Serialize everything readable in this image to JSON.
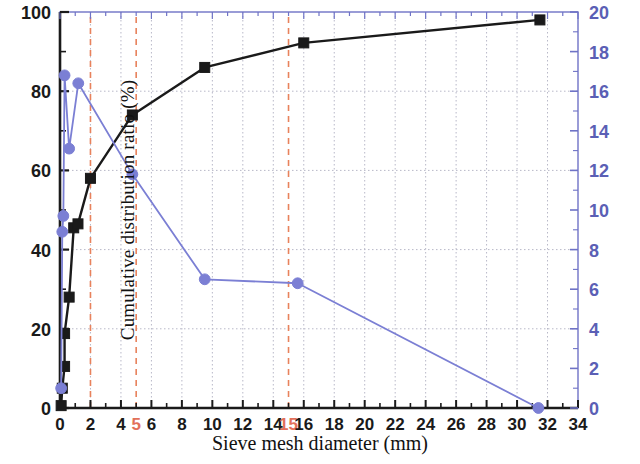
{
  "chart_data": {
    "type": "line",
    "title": "",
    "xlabel": "Sieve mesh diameter (mm)",
    "ylabel_left": "Cumulative distribution ratio (%)",
    "ylabel_right": "Interval distribution ratio (%)",
    "xlim": [
      0,
      34
    ],
    "xticks": [
      0,
      2,
      4,
      5,
      6,
      8,
      10,
      12,
      14,
      15,
      16,
      18,
      20,
      22,
      24,
      26,
      28,
      30,
      32,
      34
    ],
    "xticklabels": [
      "0",
      "2",
      "4",
      "5",
      "6",
      "8",
      "10",
      "12",
      "14",
      "15",
      "16",
      "18",
      "20",
      "22",
      "24",
      "26",
      "28",
      "30",
      "32",
      "34"
    ],
    "xtick_highlight": [
      5,
      15
    ],
    "ylim_left": [
      0,
      100
    ],
    "yticks_left": [
      0,
      20,
      40,
      60,
      80,
      100
    ],
    "yticklabels_left": [
      "0",
      "20",
      "40",
      "60",
      "80",
      "100"
    ],
    "ylim_right": [
      0,
      20
    ],
    "yticks_right": [
      0,
      2,
      4,
      6,
      8,
      10,
      12,
      14,
      16,
      18,
      20
    ],
    "yticklabels_right": [
      "0",
      "2",
      "4",
      "6",
      "8",
      "10",
      "12",
      "14",
      "16",
      "18",
      "20"
    ],
    "grid": true,
    "legend": "none",
    "annotations": {
      "vertical_dashed_lines_x": [
        2,
        5,
        15
      ],
      "dashed_line_color": "#e8825c"
    },
    "series": [
      {
        "name": "Cumulative distribution ratio",
        "axis": "left",
        "color": "#1a1a1a",
        "marker": "square",
        "points": [
          {
            "x": 0.075,
            "y": 0.6
          },
          {
            "x": 0.15,
            "y": 5.0
          },
          {
            "x": 0.3,
            "y": 10.5
          },
          {
            "x": 0.3,
            "y": 18.8
          },
          {
            "x": 0.6,
            "y": 28.0
          },
          {
            "x": 0.9,
            "y": 45.5
          },
          {
            "x": 1.18,
            "y": 46.5
          },
          {
            "x": 2.0,
            "y": 58.0
          },
          {
            "x": 4.75,
            "y": 74.0
          },
          {
            "x": 9.5,
            "y": 86.0
          },
          {
            "x": 16.0,
            "y": 92.2
          },
          {
            "x": 31.5,
            "y": 98.0
          }
        ]
      },
      {
        "name": "Interval distribution ratio",
        "axis": "right",
        "color": "#7b7fd4",
        "marker": "circle",
        "points": [
          {
            "x": 0.075,
            "y": 1.0
          },
          {
            "x": 0.15,
            "y": 8.9
          },
          {
            "x": 0.22,
            "y": 9.7
          },
          {
            "x": 0.3,
            "y": 16.8
          },
          {
            "x": 0.6,
            "y": 13.1
          },
          {
            "x": 1.2,
            "y": 16.4
          },
          {
            "x": 4.75,
            "y": 11.8
          },
          {
            "x": 9.5,
            "y": 6.5
          },
          {
            "x": 15.6,
            "y": 6.3
          },
          {
            "x": 31.4,
            "y": 0.0
          }
        ]
      }
    ]
  },
  "axes_style": {
    "frame_color": "#6f73c6",
    "left_axis_color": "#1a1a1a",
    "right_axis_color": "#6f73c6",
    "left_tick_label_color": "#1a1a1a",
    "right_tick_label_color": "#5b5fb5",
    "x_tick_label_color": "#1a1a1a",
    "highlight_tick_color": "#e2705a",
    "grid_color": "#b8b8c8"
  }
}
